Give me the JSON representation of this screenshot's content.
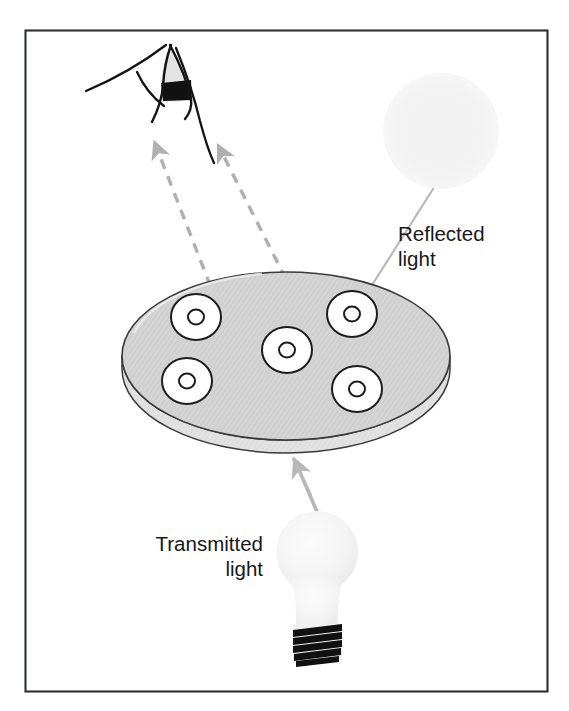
{
  "figure": {
    "kind": "optical-diagram",
    "caption_present": false,
    "frame": {
      "border_color": "#2b2f33",
      "background": "#ffffff",
      "x": 25,
      "y": 30,
      "width": 523,
      "height": 662
    },
    "labels": [
      {
        "id": "reflected",
        "name": "reflected-light-label",
        "line1": "Reflected",
        "line2": "light",
        "x": 398,
        "y": 241,
        "align": "start",
        "color": "#16181a"
      },
      {
        "id": "transmitted",
        "name": "transmitted-light-label",
        "line1": "Transmitted",
        "line2": "light",
        "x": 263,
        "y": 551,
        "align": "end",
        "color": "#16181a"
      }
    ],
    "colors": {
      "outline": "#1c1c1c",
      "plate_fill": "#d2d2d2",
      "plate_rim": "#dcdcdc",
      "well_fill": "#ffffff",
      "ray_gray": "#b0b0b0",
      "leader_gray": "#b9b9b9",
      "lamp_glass": "#f4f4f4",
      "lamp_base": "#111111",
      "reflected_source_fill": "#f3f3f3",
      "eye_iris": "#111111",
      "eye_sclera": "#e3e3e3"
    },
    "eye": {
      "name": "eye-icon",
      "description": "side view of an eye with dark iris band",
      "cx": 170,
      "cy": 85
    },
    "reflected_source": {
      "name": "reflected-light-source-glow",
      "cx": 441,
      "cy": 131,
      "r": 58
    },
    "plate": {
      "name": "sample-plate",
      "cx": 286,
      "cy": 356,
      "rx": 164,
      "ry": 84,
      "thickness": 16,
      "hatched": true
    },
    "wells": [
      {
        "name": "well-top-left",
        "cx": 196,
        "cy": 317,
        "r_outer": 24,
        "r_inner": 7.5
      },
      {
        "name": "well-bottom-left",
        "cx": 187,
        "cy": 381,
        "r_outer": 24,
        "r_inner": 7.5
      },
      {
        "name": "well-center",
        "cx": 287,
        "cy": 350,
        "r_outer": 24,
        "r_inner": 7.5
      },
      {
        "name": "well-top-right",
        "cx": 352,
        "cy": 314,
        "r_outer": 24,
        "r_inner": 7.5
      },
      {
        "name": "well-bottom-right",
        "cx": 357,
        "cy": 389,
        "r_outer": 24,
        "r_inner": 7.5
      }
    ],
    "rays": [
      {
        "name": "reflected-ray-left",
        "style": "dashed-arrow",
        "from": {
          "x": 215,
          "y": 300
        },
        "to": {
          "x": 155,
          "y": 144
        },
        "color": "#b0b0b0"
      },
      {
        "name": "reflected-ray-right",
        "style": "dashed-arrow",
        "from": {
          "x": 292,
          "y": 292
        },
        "to": {
          "x": 218,
          "y": 147
        },
        "color": "#b0b0b0"
      },
      {
        "name": "transmitted-ray",
        "style": "solid-arrow",
        "from": {
          "x": 316,
          "y": 512
        },
        "to": {
          "x": 295,
          "y": 461
        },
        "color": "#b7b7b7"
      }
    ],
    "leaders": [
      {
        "name": "reflected-source-leader",
        "from": {
          "x": 432,
          "y": 190
        },
        "to": {
          "x": 352,
          "y": 314
        },
        "color": "#b9b9b9"
      },
      {
        "name": "lamp-leader",
        "from": {
          "x": 310,
          "y": 493
        },
        "to": {
          "x": 291,
          "y": 456
        },
        "color": "#b9b9b9"
      }
    ],
    "lamp": {
      "name": "light-bulb",
      "bulb_cx": 316,
      "bulb_cy": 553,
      "bulb_r": 40,
      "neck_top": 585,
      "base_top": 623,
      "base_bottom": 662,
      "thread_count": 6
    }
  }
}
